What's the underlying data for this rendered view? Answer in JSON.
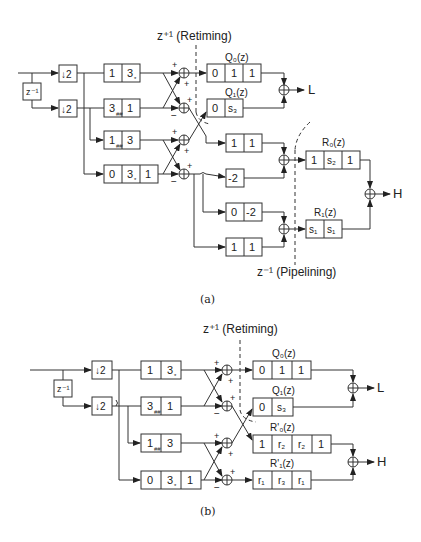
{
  "figure_a": {
    "caption": "(a)",
    "retiming_label": "z⁺¹ (Retiming)",
    "pipelining_label": "z⁻¹ (Pipelining)",
    "delay": "z⁻¹",
    "downsamplers": [
      "↓2",
      "↓2"
    ],
    "filters_left": [
      {
        "cells": [
          "1",
          "3"
        ],
        "marks": [
          "",
          "*"
        ]
      },
      {
        "cells": [
          "3",
          "1"
        ],
        "marks": [
          "##",
          ""
        ]
      },
      {
        "cells": [
          "1",
          "3"
        ],
        "marks": [
          "##",
          ""
        ]
      },
      {
        "cells": [
          "0",
          "3",
          "1"
        ],
        "marks": [
          "",
          "*",
          ""
        ]
      }
    ],
    "q0": {
      "label": "Q₀(z)",
      "cells": [
        "0",
        "1",
        "1"
      ]
    },
    "q1": {
      "label": "Q₁(z)",
      "cells": [
        "0",
        "s₃"
      ]
    },
    "mid_blocks": [
      [
        "1",
        "1"
      ],
      [
        "-2"
      ],
      [
        "0",
        "-2"
      ],
      [
        "1",
        "1"
      ]
    ],
    "r0": {
      "label": "R₀(z)",
      "cells": [
        "1",
        "s₂",
        "1"
      ]
    },
    "r1": {
      "label": "R₁(z)",
      "cells": [
        "s₁",
        "s₁"
      ]
    },
    "outputs": [
      "L",
      "H"
    ],
    "signs": {
      "plus": "+",
      "minus": "−"
    }
  },
  "figure_b": {
    "caption": "(b)",
    "retiming_label": "z⁺¹ (Retiming)",
    "delay": "z⁻¹",
    "downsamplers": [
      "↓2",
      "↓2"
    ],
    "filters_left": [
      {
        "cells": [
          "1",
          "3"
        ],
        "marks": [
          "",
          "*"
        ]
      },
      {
        "cells": [
          "3",
          "1"
        ],
        "marks": [
          "##",
          ""
        ]
      },
      {
        "cells": [
          "1",
          "3"
        ],
        "marks": [
          "##",
          ""
        ]
      },
      {
        "cells": [
          "0",
          "3",
          "1"
        ],
        "marks": [
          "",
          "*",
          ""
        ]
      }
    ],
    "q0": {
      "label": "Q₀(z)",
      "cells": [
        "0",
        "1",
        "1"
      ]
    },
    "q1": {
      "label": "Q₁(z)",
      "cells": [
        "0",
        "s₃"
      ]
    },
    "r0p": {
      "label": "R'₀(z)",
      "cells": [
        "1",
        "r₂",
        "r₂",
        "1"
      ]
    },
    "r1p": {
      "label": "R'₁(z)",
      "cells": [
        "r₁",
        "r₃",
        "r₁"
      ]
    },
    "outputs": [
      "L",
      "H"
    ]
  }
}
